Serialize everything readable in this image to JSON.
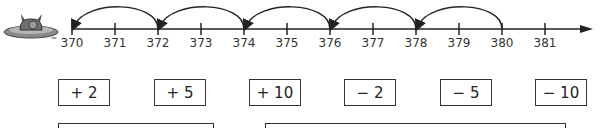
{
  "number_line": {
    "start": 370,
    "end": 381,
    "ticks": [
      "370",
      "371",
      "372",
      "373",
      "374",
      "375",
      "376",
      "377",
      "378",
      "379",
      "380",
      "381"
    ],
    "jumps": [
      {
        "from": 380,
        "to": 378
      },
      {
        "from": 378,
        "to": 376
      },
      {
        "from": 376,
        "to": 374
      },
      {
        "from": 374,
        "to": 372
      },
      {
        "from": 372,
        "to": 370
      }
    ]
  },
  "operation_choices": [
    "+ 2",
    "+ 5",
    "+ 10",
    "− 2",
    "− 5",
    "− 10"
  ],
  "answer_boxes": [
    {
      "value": ""
    },
    {
      "value": ""
    }
  ],
  "mascot": {
    "icon": "frog-on-lilypad-icon"
  }
}
